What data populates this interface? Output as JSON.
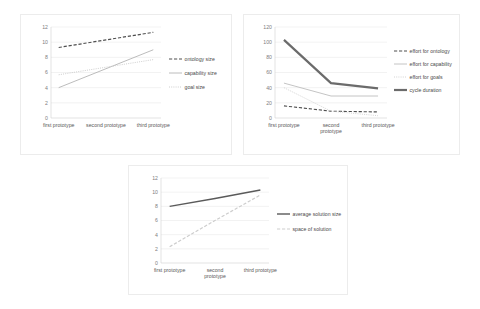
{
  "figure": {
    "background": "#ffffff",
    "panel_border": "#ececec"
  },
  "chart_data": [
    {
      "id": "chart-1",
      "type": "line",
      "title": "",
      "xlabel": "",
      "ylabel": "",
      "categories": [
        "first prototype",
        "second prototype",
        "third prototype"
      ],
      "yticks": [
        0,
        2,
        4,
        6,
        8,
        10,
        12
      ],
      "ylim": [
        0,
        12
      ],
      "grid": true,
      "legend_position": "right",
      "series": [
        {
          "name": "ontology size",
          "values": [
            9.3,
            10.3,
            11.3
          ],
          "style": "dashed",
          "color": "#4f4f4f",
          "width": 1.2
        },
        {
          "name": "capability size",
          "values": [
            4.0,
            6.5,
            9.0
          ],
          "style": "solid",
          "color": "#b4b4b4",
          "width": 0.9
        },
        {
          "name": "goal size",
          "values": [
            5.7,
            6.7,
            7.7
          ],
          "style": "dotted",
          "color": "#c8c8c8",
          "width": 0.9
        }
      ]
    },
    {
      "id": "chart-2",
      "type": "line",
      "title": "",
      "xlabel": "",
      "ylabel": "",
      "categories": [
        "first prototype",
        "second prototype",
        "third prototype"
      ],
      "yticks": [
        0,
        20,
        40,
        60,
        80,
        100,
        120
      ],
      "ylim": [
        0,
        120
      ],
      "grid": true,
      "legend_position": "right",
      "series": [
        {
          "name": "effort for ontology",
          "values": [
            16,
            9,
            8
          ],
          "style": "dashed",
          "color": "#4f4f4f",
          "width": 1.1
        },
        {
          "name": "effort for capability",
          "values": [
            46,
            29,
            29
          ],
          "style": "solid",
          "color": "#bdbdbd",
          "width": 0.9
        },
        {
          "name": "effort for goals",
          "values": [
            40,
            9,
            3
          ],
          "style": "dotted",
          "color": "#cfcfcf",
          "width": 0.9
        },
        {
          "name": "cycle duration",
          "values": [
            103,
            46,
            39
          ],
          "style": "solid",
          "color": "#6b6b6b",
          "width": 2.2
        }
      ]
    },
    {
      "id": "chart-3",
      "type": "line",
      "title": "",
      "xlabel": "",
      "ylabel": "",
      "categories": [
        "first prototype",
        "second prototype",
        "third prototype"
      ],
      "yticks": [
        0,
        2,
        4,
        6,
        8,
        10,
        12
      ],
      "ylim": [
        0,
        12
      ],
      "grid": true,
      "legend_position": "right",
      "series": [
        {
          "name": "average solution size",
          "values": [
            8.0,
            9.1,
            10.3
          ],
          "style": "solid",
          "color": "#5a5a5a",
          "width": 1.4
        },
        {
          "name": "space of solution",
          "values": [
            2.3,
            6.0,
            9.6
          ],
          "style": "dashed",
          "color": "#cdcdcd",
          "width": 1.2
        }
      ]
    }
  ]
}
